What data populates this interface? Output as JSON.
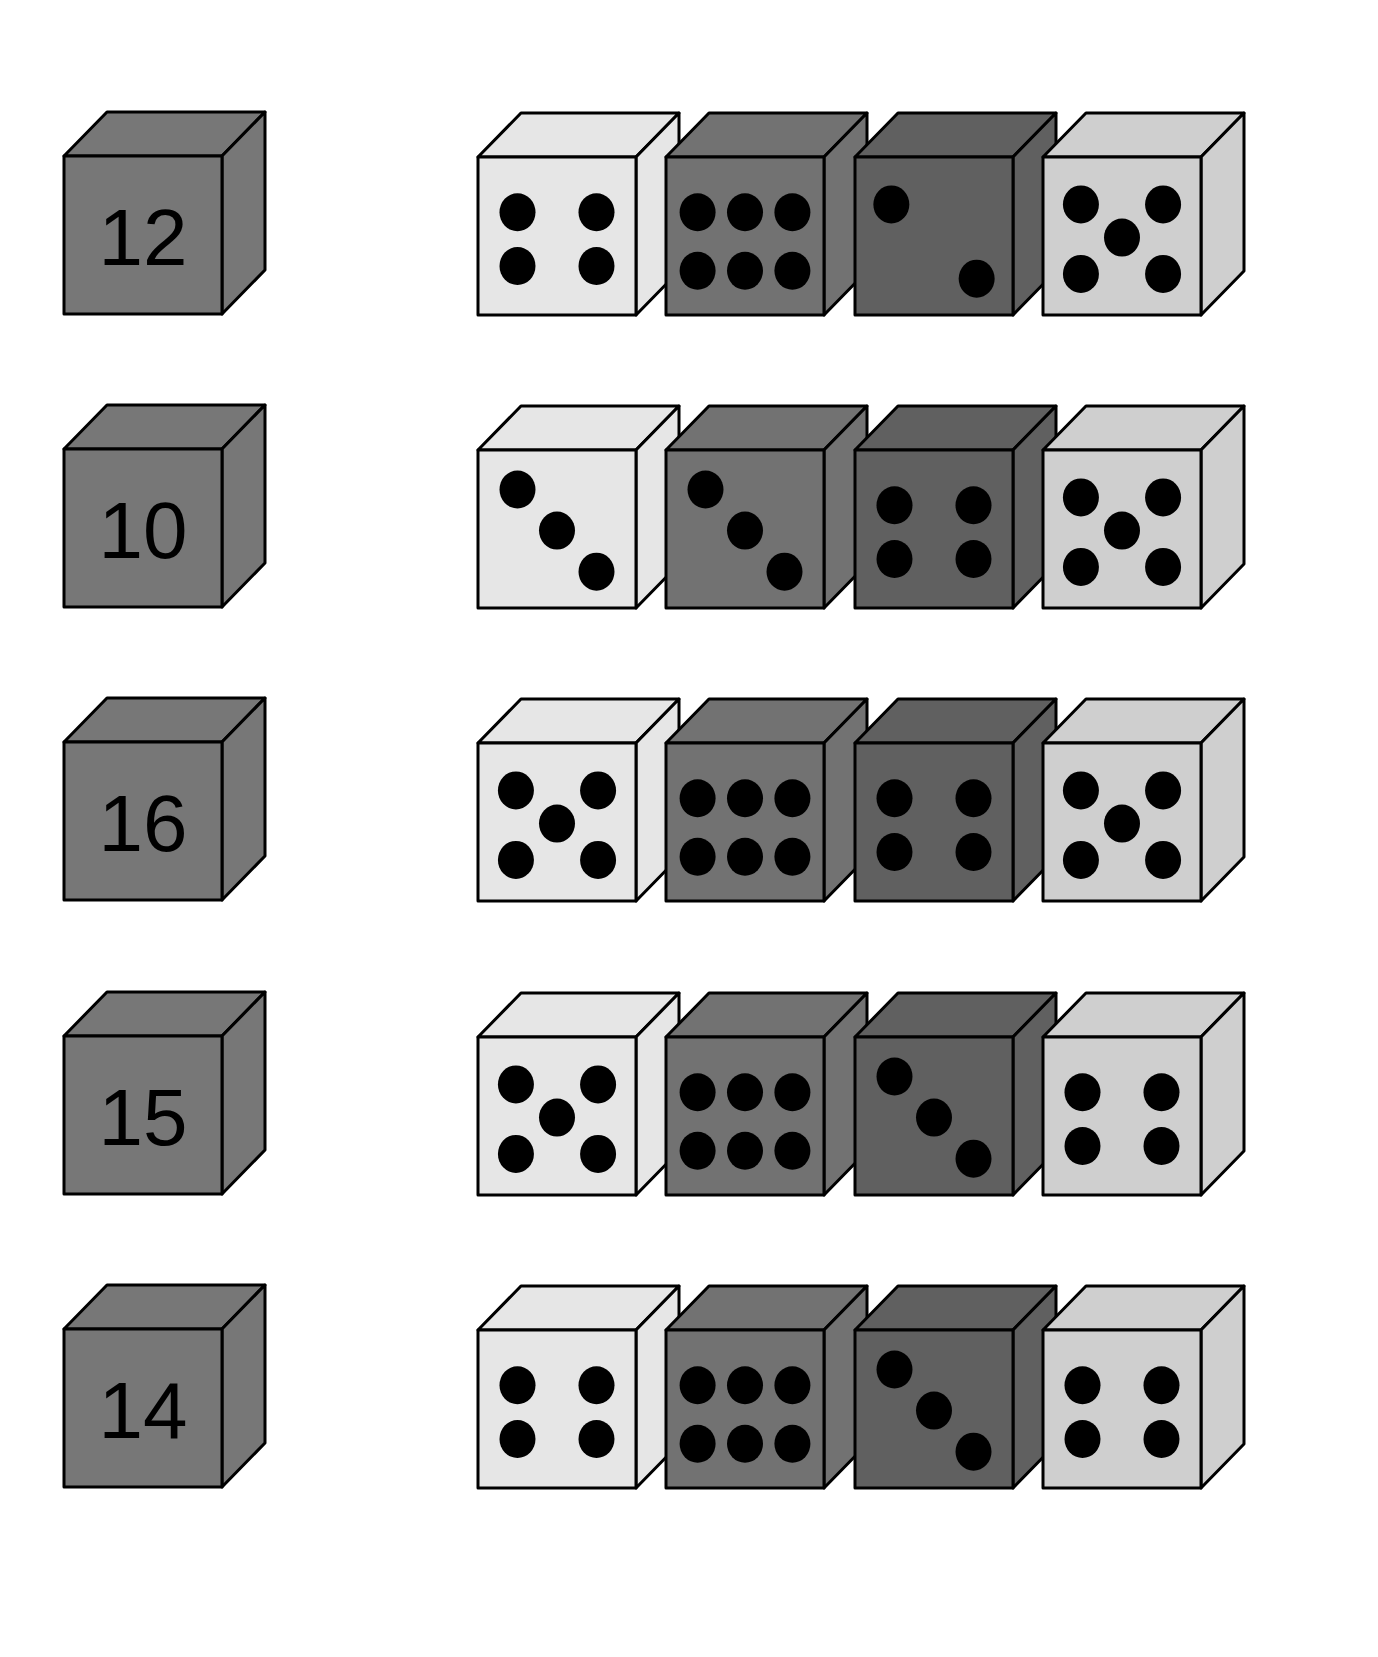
{
  "colors": {
    "background": "#ffffff",
    "outline": "#000000",
    "pip": "#000000",
    "total_cube": "#777777",
    "shades": {
      "white": "#e6e6e6",
      "mid": "#727272",
      "dark": "#606060",
      "light": "#cfcfcf"
    }
  },
  "rows": [
    {
      "total": "12",
      "dice": [
        {
          "pips": 4,
          "shade": "white"
        },
        {
          "pips": 6,
          "shade": "mid"
        },
        {
          "pips": 2,
          "shade": "dark"
        },
        {
          "pips": 5,
          "shade": "light"
        }
      ]
    },
    {
      "total": "10",
      "dice": [
        {
          "pips": 3,
          "shade": "white"
        },
        {
          "pips": 3,
          "shade": "mid"
        },
        {
          "pips": 4,
          "shade": "dark"
        },
        {
          "pips": 5,
          "shade": "light"
        }
      ]
    },
    {
      "total": "16",
      "dice": [
        {
          "pips": 5,
          "shade": "white"
        },
        {
          "pips": 6,
          "shade": "mid"
        },
        {
          "pips": 4,
          "shade": "dark"
        },
        {
          "pips": 5,
          "shade": "light"
        }
      ]
    },
    {
      "total": "15",
      "dice": [
        {
          "pips": 5,
          "shade": "white"
        },
        {
          "pips": 6,
          "shade": "mid"
        },
        {
          "pips": 3,
          "shade": "dark"
        },
        {
          "pips": 4,
          "shade": "light"
        }
      ]
    },
    {
      "total": "14",
      "dice": [
        {
          "pips": 4,
          "shade": "white"
        },
        {
          "pips": 6,
          "shade": "mid"
        },
        {
          "pips": 3,
          "shade": "dark"
        },
        {
          "pips": 4,
          "shade": "light"
        }
      ]
    }
  ]
}
